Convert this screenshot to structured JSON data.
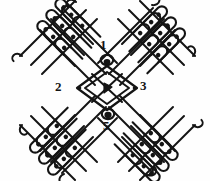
{
  "figure": {
    "background_color": "#fefefe",
    "ink_color": "#141414",
    "width": 210,
    "height": 181
  },
  "labels": [
    {
      "id": "1",
      "text": "1",
      "position": "top",
      "x": 100,
      "y": 38
    },
    {
      "id": "2",
      "text": "2",
      "position": "left",
      "x": 55,
      "y": 80
    },
    {
      "id": "3",
      "text": "3",
      "position": "right",
      "x": 140,
      "y": 79
    },
    {
      "id": "4",
      "text": "4",
      "position": "center",
      "x": 103,
      "y": 81
    },
    {
      "id": "5",
      "text": "5",
      "position": "bottom",
      "x": 103,
      "y": 119
    }
  ],
  "markers": {
    "knot_top": {
      "name": "knot-marker-top",
      "cx": 107,
      "cy": 60
    },
    "knot_bottom": {
      "name": "knot-marker-bottom",
      "cx": 108,
      "cy": 115
    },
    "arrow_center": {
      "name": "arrow-marker-center",
      "cx": 107,
      "cy": 88
    }
  },
  "arms": [
    {
      "name": "upper-left-arm",
      "direction": "northwest",
      "loop_count": 9
    },
    {
      "name": "upper-right-arm",
      "direction": "northeast",
      "loop_count": 9
    },
    {
      "name": "lower-left-arm",
      "direction": "southwest",
      "loop_count": 9
    },
    {
      "name": "lower-right-arm",
      "direction": "southeast",
      "loop_count": 9
    }
  ],
  "center": {
    "name": "central-lozenge",
    "shape": "diamond",
    "dot_left": {
      "cx": 78,
      "cy": 88
    },
    "dot_right": {
      "cx": 137,
      "cy": 88
    }
  }
}
